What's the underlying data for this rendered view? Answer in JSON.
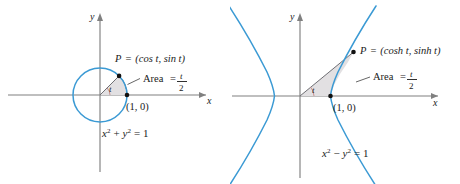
{
  "figure": {
    "caption_type": "math-figure",
    "background_color": "#ffffff",
    "curve_color": "#3b9ad4",
    "axis_color": "#808080",
    "shade_color": "#e2e0e2",
    "angle_arc_color": "#c28a8a"
  },
  "panels": [
    {
      "id": "circle-panel",
      "axis_x_label": "x",
      "axis_y_label": "y",
      "point_label_lhs": "P",
      "point_label_eq": "=",
      "point_label_rhs": "(cos t, sin t)",
      "point_label_full": "P = (cos t, sin t)",
      "area_label": "Area",
      "area_eq": "=",
      "area_numerator": "t",
      "area_denominator": "2",
      "area_label_full": "Area = t/2",
      "angle_label": "t",
      "vertex_label": "(1, 0)",
      "equation": "x2 + y2 = 1",
      "equation_base_1": "x",
      "equation_exp_1": "2",
      "equation_op": "+",
      "equation_base_2": "y",
      "equation_exp_2": "2",
      "equation_rhs": "= 1"
    },
    {
      "id": "hyperbola-panel",
      "axis_x_label": "x",
      "axis_y_label": "y",
      "point_label_lhs": "P",
      "point_label_eq": "=",
      "point_label_rhs": "(cosh t, sinh t)",
      "point_label_full": "P = (cosh t, sinh t)",
      "area_label": "Area",
      "area_eq": "=",
      "area_numerator": "t",
      "area_denominator": "2",
      "area_label_full": "Area = t/2",
      "angle_label": "t",
      "vertex_label": "(1, 0)",
      "equation": "x2 - y2 = 1",
      "equation_base_1": "x",
      "equation_exp_1": "2",
      "equation_op": "−",
      "equation_base_2": "y",
      "equation_exp_2": "2",
      "equation_rhs": "= 1"
    }
  ]
}
